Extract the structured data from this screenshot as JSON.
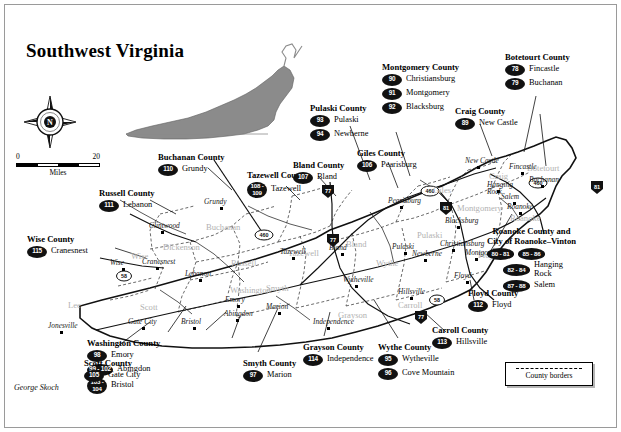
{
  "title": "Southwest Virginia",
  "credit": "George Skoch",
  "compass": {
    "label": "N",
    "name": "compass-rose"
  },
  "scale": {
    "min": "0",
    "max": "20",
    "unit": "Miles"
  },
  "legend": {
    "label": "County borders"
  },
  "callouts": [
    {
      "county": "Buchanan County",
      "x": 158,
      "y": 152,
      "entries": [
        {
          "badge": "110",
          "place": "Grundy",
          "style": "b1"
        }
      ]
    },
    {
      "county": "Russell County",
      "x": 99,
      "y": 188,
      "entries": [
        {
          "badge": "111",
          "place": "Lebanon",
          "style": "b1"
        }
      ]
    },
    {
      "county": "Wise County",
      "x": 27,
      "y": 234,
      "entries": [
        {
          "badge": "115",
          "place": "Cranesnest",
          "style": "b1"
        }
      ]
    },
    {
      "county": "Tazewell County",
      "x": 247,
      "y": 170,
      "entries": [
        {
          "badge": "108 -\n109",
          "place": "Tazewell",
          "style": "b3"
        }
      ]
    },
    {
      "county": "Bland County",
      "x": 293,
      "y": 160,
      "entries": [
        {
          "badge": "107",
          "place": "Bland",
          "style": "b1"
        }
      ]
    },
    {
      "county": "Pulaski County",
      "x": 310,
      "y": 103,
      "entries": [
        {
          "badge": "93",
          "place": "Pulaski",
          "style": "b1"
        },
        {
          "badge": "94",
          "place": "Newberne",
          "style": "b1"
        }
      ]
    },
    {
      "county": "Montgomery County",
      "x": 382,
      "y": 62,
      "entries": [
        {
          "badge": "90",
          "place": "Christiansburg",
          "style": "b1"
        },
        {
          "badge": "91",
          "place": "Montgomery",
          "style": "b1"
        },
        {
          "badge": "92",
          "place": "Blacksburg",
          "style": "b1"
        }
      ]
    },
    {
      "county": "Giles County",
      "x": 357,
      "y": 148,
      "entries": [
        {
          "badge": "106",
          "place": "Pearisburg",
          "style": "b1"
        }
      ]
    },
    {
      "county": "Craig County",
      "x": 455,
      "y": 106,
      "entries": [
        {
          "badge": "89",
          "place": "New Castle",
          "style": "b1"
        }
      ]
    },
    {
      "county": "Botetourt County",
      "x": 505,
      "y": 52,
      "entries": [
        {
          "badge": "78",
          "place": "Fincastle",
          "style": "b1"
        },
        {
          "badge": "79",
          "place": "Buchanan",
          "style": "b1"
        }
      ]
    },
    {
      "county": "Floyd County",
      "x": 468,
      "y": 288,
      "entries": [
        {
          "badge": "112",
          "place": "Floyd",
          "style": "b1"
        }
      ]
    },
    {
      "county": "Carroll County",
      "x": 432,
      "y": 325,
      "entries": [
        {
          "badge": "113",
          "place": "Hillsville",
          "style": "b1"
        }
      ]
    },
    {
      "county": "Wythe County",
      "x": 378,
      "y": 342,
      "entries": [
        {
          "badge": "95",
          "place": "Wytheville",
          "style": "b1"
        },
        {
          "badge": "96",
          "place": "Cove Mountain",
          "style": "b1"
        }
      ]
    },
    {
      "county": "Grayson County",
      "x": 303,
      "y": 342,
      "entries": [
        {
          "badge": "114",
          "place": "Independence",
          "style": "b1"
        }
      ]
    },
    {
      "county": "Smyth County",
      "x": 243,
      "y": 358,
      "entries": [
        {
          "badge": "97",
          "place": "Marion",
          "style": "b1"
        }
      ]
    },
    {
      "county": "Washington County",
      "x": 87,
      "y": 338,
      "entries": [
        {
          "badge": "98",
          "place": "Emory",
          "style": "b1"
        },
        {
          "badge": "99 - 102",
          "place": "Abingdon",
          "style": "b2"
        },
        {
          "badge": "103 -\n104",
          "place": "Bristol",
          "style": "b3"
        }
      ]
    },
    {
      "county": "Scott County",
      "x": 84,
      "y": 358,
      "entries": [
        {
          "badge": "105",
          "place": "Gate City",
          "style": "b1"
        }
      ]
    }
  ],
  "roanoke_group": {
    "county": "Roanoke County and\nCity of Roanoke–Vinton",
    "x": 487,
    "y": 227,
    "entries": [
      {
        "badge": "80 - 81",
        "place": "",
        "style": "b4"
      },
      {
        "badge": "85 - 86",
        "place": "",
        "style": "b4"
      },
      {
        "badge": "82 - 84",
        "place": "Hanging\nRock",
        "style": "b4"
      },
      {
        "badge": "87 - 88",
        "place": "Salem",
        "style": "b4"
      }
    ]
  },
  "interior_counties": [
    {
      "name": "Buchanan",
      "x": 206,
      "y": 222
    },
    {
      "name": "Dickenson",
      "x": 163,
      "y": 242
    },
    {
      "name": "Wise",
      "x": 131,
      "y": 251
    },
    {
      "name": "Russell",
      "x": 231,
      "y": 258
    },
    {
      "name": "Tazewell",
      "x": 288,
      "y": 248
    },
    {
      "name": "Bland",
      "x": 346,
      "y": 239
    },
    {
      "name": "Pulaski",
      "x": 417,
      "y": 230
    },
    {
      "name": "Giles",
      "x": 433,
      "y": 185
    },
    {
      "name": "Craig",
      "x": 489,
      "y": 171
    },
    {
      "name": "Montgomery",
      "x": 457,
      "y": 203
    },
    {
      "name": "Roanoke",
      "x": 510,
      "y": 213
    },
    {
      "name": "Botetourt",
      "x": 527,
      "y": 163
    },
    {
      "name": "Floyd",
      "x": 478,
      "y": 250
    },
    {
      "name": "Wythe",
      "x": 376,
      "y": 258
    },
    {
      "name": "Carroll",
      "x": 398,
      "y": 300
    },
    {
      "name": "Grayson",
      "x": 338,
      "y": 310
    },
    {
      "name": "Smyth",
      "x": 266,
      "y": 283
    },
    {
      "name": "Washington",
      "x": 230,
      "y": 285
    },
    {
      "name": "Scott",
      "x": 140,
      "y": 302
    },
    {
      "name": "Lee",
      "x": 68,
      "y": 300
    }
  ],
  "interior_towns": [
    {
      "name": "Grundy",
      "x": 220,
      "y": 198,
      "dx": 16,
      "dy": 9
    },
    {
      "name": "Clintwood",
      "x": 161,
      "y": 222,
      "dx": 12,
      "dy": 9
    },
    {
      "name": "Cranesnest",
      "x": 156,
      "y": 258,
      "dx": 14,
      "dy": 9
    },
    {
      "name": "Wise",
      "x": 122,
      "y": 259,
      "dx": 12,
      "dy": 9
    },
    {
      "name": "Lebanon",
      "x": 199,
      "y": 270,
      "dx": 14,
      "dy": 9
    },
    {
      "name": "Jonesville",
      "x": 60,
      "y": 322,
      "dx": 12,
      "dy": 9
    },
    {
      "name": "Gate City",
      "x": 142,
      "y": 318,
      "dx": 14,
      "dy": 9
    },
    {
      "name": "Bristol",
      "x": 193,
      "y": 318,
      "dx": 12,
      "dy": 9
    },
    {
      "name": "Abingdon",
      "x": 236,
      "y": 310,
      "dx": 12,
      "dy": 9
    },
    {
      "name": "Emory",
      "x": 237,
      "y": 296,
      "dx": 12,
      "dy": 9
    },
    {
      "name": "Marion",
      "x": 278,
      "y": 303,
      "dx": 12,
      "dy": 9
    },
    {
      "name": "Independence",
      "x": 327,
      "y": 318,
      "dx": 14,
      "dy": 9
    },
    {
      "name": "Wytheville",
      "x": 355,
      "y": 276,
      "dx": 12,
      "dy": 9
    },
    {
      "name": "Hillsville",
      "x": 410,
      "y": 288,
      "dx": 12,
      "dy": 9
    },
    {
      "name": "Bland",
      "x": 341,
      "y": 244,
      "dx": 12,
      "dy": 9
    },
    {
      "name": "Tazewell",
      "x": 292,
      "y": 248,
      "dx": 12,
      "dy": 9
    },
    {
      "name": "Pulaski",
      "x": 404,
      "y": 243,
      "dx": 12,
      "dy": 9
    },
    {
      "name": "Newberne",
      "x": 424,
      "y": 250,
      "dx": 12,
      "dy": 9
    },
    {
      "name": "Christiansburg",
      "x": 452,
      "y": 240,
      "dx": 12,
      "dy": 9
    },
    {
      "name": "Montgomery",
      "x": 475,
      "y": 249,
      "dx": 10,
      "dy": 9
    },
    {
      "name": "Blacksburg",
      "x": 457,
      "y": 217,
      "dx": 12,
      "dy": 9
    },
    {
      "name": "Pearisburg",
      "x": 400,
      "y": 197,
      "dx": 12,
      "dy": 9
    },
    {
      "name": "New Castle",
      "x": 477,
      "y": 157,
      "dx": 12,
      "dy": 9
    },
    {
      "name": "Fincastle",
      "x": 521,
      "y": 163,
      "dx": 12,
      "dy": 9
    },
    {
      "name": "Buchanan",
      "x": 541,
      "y": 176,
      "dx": 12,
      "dy": 9
    },
    {
      "name": "Hanging\nRock",
      "x": 497,
      "y": 181,
      "dx": 10,
      "dy": 9
    },
    {
      "name": "Salem",
      "x": 513,
      "y": 193,
      "dx": 12,
      "dy": 9
    },
    {
      "name": "Roanoke",
      "x": 519,
      "y": 203,
      "dx": 12,
      "dy": 9
    },
    {
      "name": "Floyd",
      "x": 466,
      "y": 272,
      "dx": 12,
      "dy": 9
    }
  ],
  "highways": [
    {
      "label": "77",
      "type": "interstate",
      "x": 328,
      "y": 191
    },
    {
      "label": "77",
      "type": "interstate",
      "x": 333,
      "y": 240
    },
    {
      "label": "81",
      "type": "interstate",
      "x": 446,
      "y": 208
    },
    {
      "label": "81",
      "type": "interstate",
      "x": 597,
      "y": 187
    },
    {
      "label": "460",
      "type": "us",
      "x": 264,
      "y": 236
    },
    {
      "label": "460",
      "type": "us",
      "x": 430,
      "y": 192
    },
    {
      "label": "460",
      "type": "us",
      "x": 538,
      "y": 184
    },
    {
      "label": "58",
      "type": "us",
      "x": 124,
      "y": 277
    },
    {
      "label": "58",
      "type": "us",
      "x": 437,
      "y": 301
    },
    {
      "label": "77",
      "type": "interstate",
      "x": 421,
      "y": 317
    }
  ]
}
